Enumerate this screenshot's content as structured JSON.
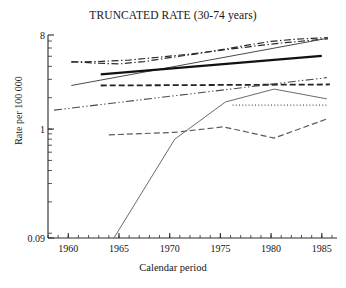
{
  "chart_data": {
    "type": "line",
    "title": "TRUNCATED RATE (30-74 years)",
    "xlabel": "Calendar period",
    "ylabel": "Rate per 100 000",
    "yscale": "log",
    "ylim": [
      0.09,
      8
    ],
    "xlim": [
      1958,
      1986.5
    ],
    "grid": false,
    "legend": "none",
    "y_tick_labels": [
      "8",
      "1",
      "0.09"
    ],
    "y_tick_values": [
      8,
      1,
      0.09
    ],
    "x_tick_labels": [
      "1960",
      "1965",
      "1970",
      "1975",
      "1980",
      "1985"
    ],
    "x_tick_values": [
      1960,
      1965,
      1970,
      1975,
      1980,
      1985
    ],
    "x_minor_step": 1,
    "series": [
      {
        "name": "series-1-dashdot-upper",
        "style": "dashdot",
        "width": 1.2,
        "color": "#2b2b2b",
        "x": [
          1960.3,
          1962.5,
          1965.0,
          1967.5,
          1970.0,
          1972.5,
          1975.0,
          1977.5,
          1980.0,
          1982.5,
          1985.6
        ],
        "y": [
          4.45,
          4.3,
          4.22,
          4.45,
          4.85,
          5.25,
          5.75,
          6.35,
          6.95,
          7.3,
          7.55
        ]
      },
      {
        "name": "series-2-dashdot-upper-b",
        "style": "dashdot",
        "width": 1.2,
        "color": "#2b2b2b",
        "x": [
          1960.3,
          1963.0,
          1966.0,
          1969.0,
          1972.0,
          1975.0,
          1978.0,
          1981.0,
          1985.6
        ],
        "y": [
          4.4,
          4.45,
          4.6,
          4.9,
          5.25,
          5.7,
          6.2,
          6.7,
          7.35
        ]
      },
      {
        "name": "series-3-solid-thin-rising",
        "style": "solid",
        "width": 1.0,
        "color": "#4a4a4a",
        "x": [
          1960.3,
          1985.6
        ],
        "y": [
          2.62,
          7.45
        ]
      },
      {
        "name": "series-4-solid-thick",
        "style": "solid",
        "width": 2.3,
        "color": "#111111",
        "x": [
          1963.2,
          1985.0
        ],
        "y": [
          3.35,
          5.05
        ]
      },
      {
        "name": "series-5-dashed-flat",
        "style": "dashed",
        "width": 1.8,
        "color": "#222222",
        "x": [
          1963.2,
          1985.8
        ],
        "y": [
          2.62,
          2.68
        ]
      },
      {
        "name": "series-6-dashdotdot-rising",
        "style": "dashdotdot",
        "width": 1.1,
        "color": "#4a4a4a",
        "x": [
          1958.6,
          1985.5
        ],
        "y": [
          1.52,
          3.12
        ]
      },
      {
        "name": "series-7-solid-peak",
        "style": "solid",
        "width": 1.0,
        "color": "#6a6a6a",
        "x": [
          1964.5,
          1970.5,
          1975.5,
          1980.3,
          1985.5
        ],
        "y": [
          0.09,
          0.8,
          1.82,
          2.42,
          1.95
        ]
      },
      {
        "name": "series-8-dotted-flat",
        "style": "dotted",
        "width": 1.2,
        "color": "#555555",
        "x": [
          1976.2,
          1985.6
        ],
        "y": [
          1.7,
          1.7
        ]
      },
      {
        "name": "series-9-dashed-low",
        "style": "dashed",
        "width": 1.2,
        "color": "#5a5a5a",
        "x": [
          1964.0,
          1970.5,
          1975.3,
          1980.3,
          1985.5
        ],
        "y": [
          0.88,
          0.93,
          1.05,
          0.82,
          1.25
        ]
      }
    ]
  }
}
